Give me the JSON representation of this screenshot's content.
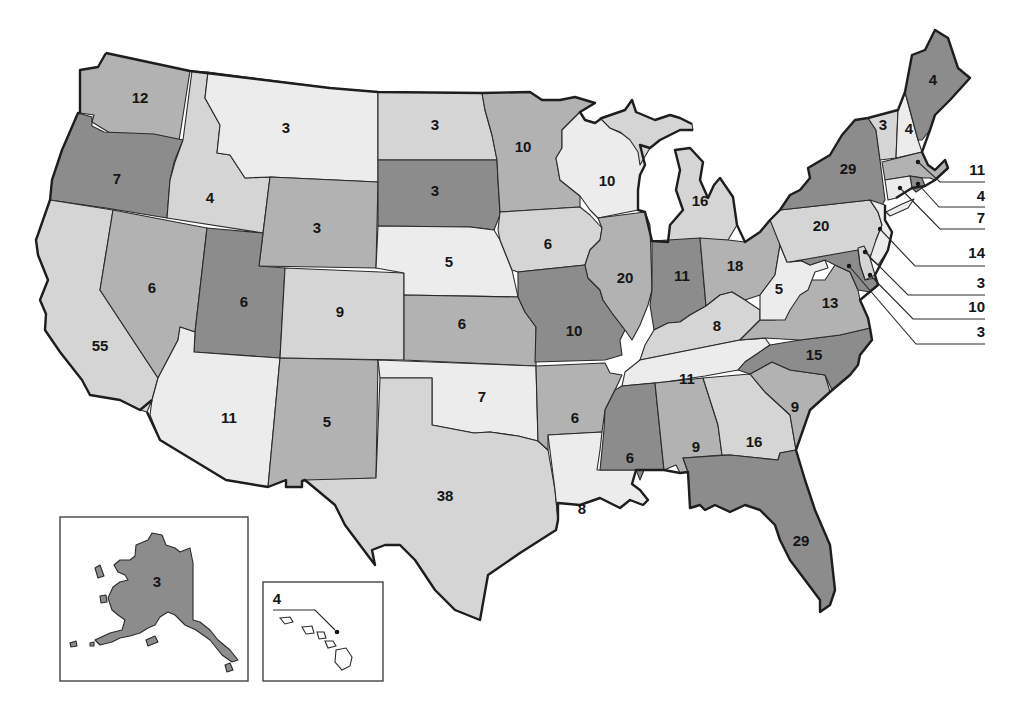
{
  "map": {
    "subject": "Electoral votes by state",
    "tier_colors": {
      "dark": "#8c8c8c",
      "mid": "#b2b2b2",
      "light": "#d5d5d5",
      "pale": "#ececec"
    },
    "states": {
      "WA": {
        "name": "Washington",
        "votes": "12",
        "tier": "mid"
      },
      "OR": {
        "name": "Oregon",
        "votes": "7",
        "tier": "dark"
      },
      "CA": {
        "name": "California",
        "votes": "55",
        "tier": "light"
      },
      "ID": {
        "name": "Idaho",
        "votes": "4",
        "tier": "light"
      },
      "NV": {
        "name": "Nevada",
        "votes": "6",
        "tier": "mid"
      },
      "MT": {
        "name": "Montana",
        "votes": "3",
        "tier": "pale"
      },
      "WY": {
        "name": "Wyoming",
        "votes": "3",
        "tier": "mid"
      },
      "UT": {
        "name": "Utah",
        "votes": "6",
        "tier": "dark"
      },
      "AZ": {
        "name": "Arizona",
        "votes": "11",
        "tier": "pale"
      },
      "CO": {
        "name": "Colorado",
        "votes": "9",
        "tier": "light"
      },
      "NM": {
        "name": "New Mexico",
        "votes": "5",
        "tier": "mid"
      },
      "ND": {
        "name": "North Dakota",
        "votes": "3",
        "tier": "light"
      },
      "SD": {
        "name": "South Dakota",
        "votes": "3",
        "tier": "dark"
      },
      "NE": {
        "name": "Nebraska",
        "votes": "5",
        "tier": "pale"
      },
      "KS": {
        "name": "Kansas",
        "votes": "6",
        "tier": "mid"
      },
      "OK": {
        "name": "Oklahoma",
        "votes": "7",
        "tier": "pale"
      },
      "TX": {
        "name": "Texas",
        "votes": "38",
        "tier": "light"
      },
      "MN": {
        "name": "Minnesota",
        "votes": "10",
        "tier": "mid"
      },
      "IA": {
        "name": "Iowa",
        "votes": "6",
        "tier": "light"
      },
      "MO": {
        "name": "Missouri",
        "votes": "10",
        "tier": "dark"
      },
      "AR": {
        "name": "Arkansas",
        "votes": "6",
        "tier": "mid"
      },
      "LA": {
        "name": "Louisiana",
        "votes": "8",
        "tier": "pale"
      },
      "WI": {
        "name": "Wisconsin",
        "votes": "10",
        "tier": "pale"
      },
      "IL": {
        "name": "Illinois",
        "votes": "20",
        "tier": "mid"
      },
      "MI": {
        "name": "Michigan",
        "votes": "16",
        "tier": "light"
      },
      "IN": {
        "name": "Indiana",
        "votes": "11",
        "tier": "dark"
      },
      "OH": {
        "name": "Ohio",
        "votes": "18",
        "tier": "mid"
      },
      "KY": {
        "name": "Kentucky",
        "votes": "8",
        "tier": "light"
      },
      "TN": {
        "name": "Tennessee",
        "votes": "11",
        "tier": "pale"
      },
      "MS": {
        "name": "Mississippi",
        "votes": "6",
        "tier": "dark"
      },
      "AL": {
        "name": "Alabama",
        "votes": "9",
        "tier": "mid"
      },
      "GA": {
        "name": "Georgia",
        "votes": "16",
        "tier": "light"
      },
      "FL": {
        "name": "Florida",
        "votes": "29",
        "tier": "dark"
      },
      "SC": {
        "name": "South Carolina",
        "votes": "9",
        "tier": "mid"
      },
      "NC": {
        "name": "North Carolina",
        "votes": "15",
        "tier": "dark"
      },
      "VA": {
        "name": "Virginia",
        "votes": "13",
        "tier": "mid"
      },
      "WV": {
        "name": "West Virginia",
        "votes": "5",
        "tier": "pale"
      },
      "PA": {
        "name": "Pennsylvania",
        "votes": "20",
        "tier": "light"
      },
      "NY": {
        "name": "New York",
        "votes": "29",
        "tier": "dark"
      },
      "VT": {
        "name": "Vermont",
        "votes": "3",
        "tier": "light"
      },
      "NH": {
        "name": "New Hampshire",
        "votes": "4",
        "tier": "pale"
      },
      "ME": {
        "name": "Maine",
        "votes": "4",
        "tier": "dark"
      },
      "MA": {
        "name": "Massachusetts",
        "votes": "11",
        "tier": "mid"
      },
      "RI": {
        "name": "Rhode Island",
        "votes": "4",
        "tier": "dark"
      },
      "CT": {
        "name": "Connecticut",
        "votes": "7",
        "tier": "pale"
      },
      "NJ": {
        "name": "New Jersey",
        "votes": "14",
        "tier": "pale"
      },
      "DE": {
        "name": "Delaware",
        "votes": "3",
        "tier": "light"
      },
      "MD": {
        "name": "Maryland",
        "votes": "10",
        "tier": "dark"
      },
      "DC": {
        "name": "District of Columbia",
        "votes": "3",
        "tier": "dark"
      },
      "AK": {
        "name": "Alaska",
        "votes": "3",
        "tier": "dark"
      },
      "HI": {
        "name": "Hawaii",
        "votes": "4",
        "tier": "pale"
      }
    },
    "callouts": [
      {
        "state": "MA",
        "label": "11"
      },
      {
        "state": "RI",
        "label": "4"
      },
      {
        "state": "CT",
        "label": "7"
      },
      {
        "state": "NJ",
        "label": "14"
      },
      {
        "state": "DE",
        "label": "3"
      },
      {
        "state": "MD",
        "label": "10"
      },
      {
        "state": "DC",
        "label": "3"
      }
    ],
    "insets": [
      {
        "state": "AK",
        "label": "3"
      },
      {
        "state": "HI",
        "label": "4"
      }
    ]
  }
}
